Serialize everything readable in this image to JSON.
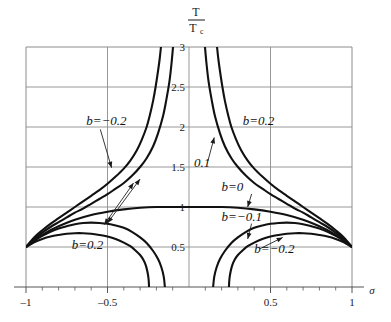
{
  "chart_data": {
    "type": "line",
    "title": "",
    "xlabel": "σ",
    "ylabel_numerator": "T",
    "ylabel_denominator": "T",
    "ylabel_denominator_sub": "c",
    "xlim": [
      -1,
      1
    ],
    "ylim": [
      0,
      3
    ],
    "grid": true,
    "legend_position": "inline-annotations",
    "xticks": [
      -1,
      -0.5,
      0.5,
      1
    ],
    "xtick_labels": [
      "–1",
      "–0.5",
      "0.5",
      "1"
    ],
    "yticks": [
      0.5,
      1,
      1.5,
      2,
      2.5,
      3
    ],
    "ytick_labels": [
      "0.5",
      "1",
      "1.5",
      "2",
      "2.5",
      "3"
    ],
    "x_minor_ticks": [
      -0.9,
      -0.8,
      -0.7,
      -0.6,
      -0.4,
      -0.3,
      -0.2,
      -0.1,
      0.1,
      0.2,
      0.3,
      0.4,
      0.6,
      0.7,
      0.8,
      0.9
    ],
    "series": [
      {
        "name": "b=-0.2 upper",
        "b": -0.2,
        "points": [
          [
            -1,
            0.5
          ],
          [
            -0.95,
            0.62
          ],
          [
            -0.9,
            0.71
          ],
          [
            -0.85,
            0.79
          ],
          [
            -0.8,
            0.86
          ],
          [
            -0.75,
            0.93
          ],
          [
            -0.7,
            1.0
          ],
          [
            -0.65,
            1.07
          ],
          [
            -0.6,
            1.14
          ],
          [
            -0.55,
            1.21
          ],
          [
            -0.5,
            1.29
          ],
          [
            -0.45,
            1.38
          ],
          [
            -0.4,
            1.48
          ],
          [
            -0.36,
            1.58
          ],
          [
            -0.32,
            1.71
          ],
          [
            -0.29,
            1.84
          ],
          [
            -0.26,
            2.0
          ],
          [
            -0.24,
            2.15
          ],
          [
            -0.22,
            2.33
          ],
          [
            -0.205,
            2.5
          ],
          [
            -0.19,
            2.7
          ],
          [
            -0.18,
            2.85
          ],
          [
            -0.172,
            3.0
          ]
        ]
      },
      {
        "name": "b=-0.1 upper",
        "b": -0.1,
        "points": [
          [
            -1,
            0.5
          ],
          [
            -0.95,
            0.6
          ],
          [
            -0.9,
            0.68
          ],
          [
            -0.85,
            0.75
          ],
          [
            -0.8,
            0.81
          ],
          [
            -0.75,
            0.87
          ],
          [
            -0.7,
            0.93
          ],
          [
            -0.65,
            0.98
          ],
          [
            -0.6,
            1.04
          ],
          [
            -0.55,
            1.1
          ],
          [
            -0.5,
            1.16
          ],
          [
            -0.45,
            1.23
          ],
          [
            -0.4,
            1.3
          ],
          [
            -0.35,
            1.39
          ],
          [
            -0.3,
            1.5
          ],
          [
            -0.26,
            1.61
          ],
          [
            -0.22,
            1.76
          ],
          [
            -0.19,
            1.92
          ],
          [
            -0.16,
            2.13
          ],
          [
            -0.14,
            2.33
          ],
          [
            -0.12,
            2.57
          ],
          [
            -0.107,
            2.8
          ],
          [
            -0.098,
            3.0
          ]
        ]
      },
      {
        "name": "b=0",
        "b": 0,
        "points": [
          [
            -1,
            0.5
          ],
          [
            -0.95,
            0.58
          ],
          [
            -0.9,
            0.65
          ],
          [
            -0.85,
            0.71
          ],
          [
            -0.8,
            0.76
          ],
          [
            -0.7,
            0.84
          ],
          [
            -0.6,
            0.9
          ],
          [
            -0.5,
            0.94
          ],
          [
            -0.4,
            0.97
          ],
          [
            -0.3,
            0.99
          ],
          [
            -0.2,
            1.0
          ],
          [
            -0.1,
            1.0
          ],
          [
            0,
            1.0
          ],
          [
            0.1,
            1.0
          ],
          [
            0.2,
            1.0
          ],
          [
            0.3,
            0.99
          ],
          [
            0.4,
            0.97
          ],
          [
            0.5,
            0.94
          ],
          [
            0.6,
            0.9
          ],
          [
            0.7,
            0.84
          ],
          [
            0.8,
            0.76
          ],
          [
            0.85,
            0.71
          ],
          [
            0.9,
            0.65
          ],
          [
            0.95,
            0.58
          ],
          [
            1,
            0.5
          ]
        ]
      },
      {
        "name": "b=0.1 upper",
        "b": 0.1,
        "points": [
          [
            1,
            0.5
          ],
          [
            0.95,
            0.6
          ],
          [
            0.9,
            0.68
          ],
          [
            0.85,
            0.75
          ],
          [
            0.8,
            0.81
          ],
          [
            0.75,
            0.87
          ],
          [
            0.7,
            0.93
          ],
          [
            0.65,
            0.98
          ],
          [
            0.6,
            1.04
          ],
          [
            0.55,
            1.1
          ],
          [
            0.5,
            1.16
          ],
          [
            0.45,
            1.23
          ],
          [
            0.4,
            1.3
          ],
          [
            0.35,
            1.39
          ],
          [
            0.3,
            1.5
          ],
          [
            0.26,
            1.61
          ],
          [
            0.22,
            1.76
          ],
          [
            0.19,
            1.92
          ],
          [
            0.16,
            2.13
          ],
          [
            0.14,
            2.33
          ],
          [
            0.12,
            2.57
          ],
          [
            0.107,
            2.8
          ],
          [
            0.098,
            3.0
          ]
        ]
      },
      {
        "name": "b=0.2 upper",
        "b": 0.2,
        "points": [
          [
            1,
            0.5
          ],
          [
            0.95,
            0.62
          ],
          [
            0.9,
            0.71
          ],
          [
            0.85,
            0.79
          ],
          [
            0.8,
            0.86
          ],
          [
            0.75,
            0.93
          ],
          [
            0.7,
            1.0
          ],
          [
            0.65,
            1.07
          ],
          [
            0.6,
            1.14
          ],
          [
            0.55,
            1.21
          ],
          [
            0.5,
            1.29
          ],
          [
            0.45,
            1.38
          ],
          [
            0.4,
            1.48
          ],
          [
            0.36,
            1.58
          ],
          [
            0.32,
            1.71
          ],
          [
            0.29,
            1.84
          ],
          [
            0.26,
            2.0
          ],
          [
            0.24,
            2.15
          ],
          [
            0.22,
            2.33
          ],
          [
            0.205,
            2.5
          ],
          [
            0.19,
            2.7
          ],
          [
            0.18,
            2.85
          ],
          [
            0.172,
            3.0
          ]
        ]
      },
      {
        "name": "b=0.2 lower",
        "b": 0.2,
        "points": [
          [
            -1,
            0.5
          ],
          [
            -0.95,
            0.56
          ],
          [
            -0.9,
            0.6
          ],
          [
            -0.85,
            0.63
          ],
          [
            -0.8,
            0.65
          ],
          [
            -0.75,
            0.665
          ],
          [
            -0.7,
            0.672
          ],
          [
            -0.65,
            0.672
          ],
          [
            -0.6,
            0.665
          ],
          [
            -0.55,
            0.65
          ],
          [
            -0.5,
            0.63
          ],
          [
            -0.45,
            0.6
          ],
          [
            -0.4,
            0.555
          ],
          [
            -0.36,
            0.51
          ],
          [
            -0.33,
            0.46
          ],
          [
            -0.3,
            0.4
          ],
          [
            -0.28,
            0.34
          ],
          [
            -0.265,
            0.27
          ],
          [
            -0.255,
            0.19
          ],
          [
            -0.248,
            0.1
          ],
          [
            -0.245,
            0.0
          ]
        ]
      },
      {
        "name": "b=0.1 lower",
        "b": 0.1,
        "points": [
          [
            -1,
            0.5
          ],
          [
            -0.95,
            0.58
          ],
          [
            -0.9,
            0.64
          ],
          [
            -0.85,
            0.69
          ],
          [
            -0.8,
            0.73
          ],
          [
            -0.75,
            0.76
          ],
          [
            -0.7,
            0.785
          ],
          [
            -0.65,
            0.8
          ],
          [
            -0.6,
            0.805
          ],
          [
            -0.55,
            0.8
          ],
          [
            -0.5,
            0.79
          ],
          [
            -0.45,
            0.77
          ],
          [
            -0.4,
            0.74
          ],
          [
            -0.35,
            0.69
          ],
          [
            -0.3,
            0.62
          ],
          [
            -0.26,
            0.55
          ],
          [
            -0.22,
            0.45
          ],
          [
            -0.19,
            0.35
          ],
          [
            -0.17,
            0.25
          ],
          [
            -0.155,
            0.13
          ],
          [
            -0.148,
            0.0
          ]
        ]
      },
      {
        "name": "b=-0.1 lower",
        "b": -0.1,
        "points": [
          [
            1,
            0.5
          ],
          [
            0.95,
            0.58
          ],
          [
            0.9,
            0.64
          ],
          [
            0.85,
            0.69
          ],
          [
            0.8,
            0.73
          ],
          [
            0.75,
            0.76
          ],
          [
            0.7,
            0.785
          ],
          [
            0.65,
            0.8
          ],
          [
            0.6,
            0.805
          ],
          [
            0.55,
            0.8
          ],
          [
            0.5,
            0.79
          ],
          [
            0.45,
            0.77
          ],
          [
            0.4,
            0.74
          ],
          [
            0.35,
            0.69
          ],
          [
            0.3,
            0.62
          ],
          [
            0.26,
            0.55
          ],
          [
            0.22,
            0.45
          ],
          [
            0.19,
            0.35
          ],
          [
            0.17,
            0.25
          ],
          [
            0.155,
            0.13
          ],
          [
            0.148,
            0.0
          ]
        ]
      },
      {
        "name": "b=-0.2 lower",
        "b": -0.2,
        "points": [
          [
            1,
            0.5
          ],
          [
            0.95,
            0.56
          ],
          [
            0.9,
            0.6
          ],
          [
            0.85,
            0.63
          ],
          [
            0.8,
            0.65
          ],
          [
            0.75,
            0.665
          ],
          [
            0.7,
            0.672
          ],
          [
            0.65,
            0.672
          ],
          [
            0.6,
            0.665
          ],
          [
            0.55,
            0.65
          ],
          [
            0.5,
            0.63
          ],
          [
            0.45,
            0.6
          ],
          [
            0.4,
            0.555
          ],
          [
            0.36,
            0.51
          ],
          [
            0.33,
            0.46
          ],
          [
            0.3,
            0.4
          ],
          [
            0.28,
            0.34
          ],
          [
            0.265,
            0.27
          ],
          [
            0.255,
            0.19
          ],
          [
            0.248,
            0.1
          ],
          [
            0.245,
            0.0
          ]
        ]
      }
    ],
    "annotations": [
      {
        "id": "ann-b-neg02-top",
        "text": "b=−0.2",
        "x": -0.63,
        "y": 2.02,
        "arrow_to_x": -0.475,
        "arrow_to_y": 1.49
      },
      {
        "id": "ann-b-pos02-top",
        "text": "b=0.2",
        "x": 0.33,
        "y": 2.02,
        "arrow_to_x": null,
        "arrow_to_y": null
      },
      {
        "id": "ann-01",
        "text": "0.1",
        "x": 0.03,
        "y": 1.5,
        "arrow_to_x": 0.155,
        "arrow_to_y": 1.87
      },
      {
        "id": "ann-b-0",
        "text": "b=0",
        "x": 0.2,
        "y": 1.2,
        "arrow_to_x": 0.36,
        "arrow_to_y": 1.0
      },
      {
        "id": "ann-b-neg01",
        "text": "b=−0.1",
        "x": 0.2,
        "y": 0.83,
        "arrow_to_x": 0.36,
        "arrow_to_y": 0.6
      },
      {
        "id": "ann-b-pos02-bottom",
        "text": "b=0.2",
        "x": -0.72,
        "y": 0.48,
        "arrow_to_x": null,
        "arrow_to_y": null
      },
      {
        "id": "ann-b-neg02-bottom",
        "text": "b=−0.2",
        "x": 0.4,
        "y": 0.43,
        "arrow_to_x": 0.575,
        "arrow_to_y": 0.62
      },
      {
        "id": "ann-cross-arrow",
        "text": "",
        "x": -0.34,
        "y": 1.3,
        "arrow_to_x": -0.52,
        "arrow_to_y": 0.78
      }
    ],
    "colors": {
      "curve": "#111111",
      "grid": "#8c8c8c",
      "axis": "#555555",
      "text": "#1a1a1a",
      "background": "#ffffff"
    }
  }
}
